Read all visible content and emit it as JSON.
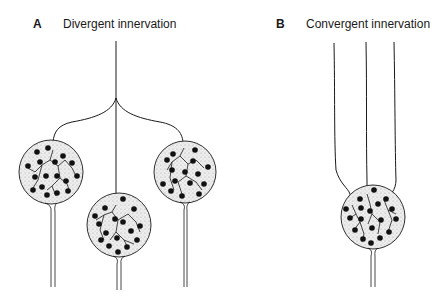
{
  "panels": [
    {
      "letter": "A",
      "title": "Divergent innervation",
      "description": "One axon branches to innervate three target cells"
    },
    {
      "letter": "B",
      "title": "Convergent innervation",
      "description": "Three axons converge onto a single target cell"
    }
  ],
  "colors": {
    "line": "#1a1a1a",
    "cell_fill": "#e6e6e6",
    "bouton": "#111111",
    "background": "#ffffff"
  }
}
